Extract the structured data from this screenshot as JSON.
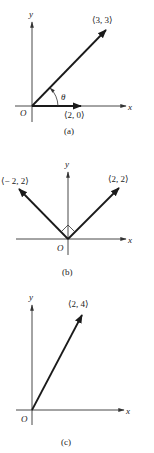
{
  "panels": [
    {
      "id": "a",
      "caption": "(a)",
      "axis_labels": {
        "x": "x",
        "y": "y",
        "origin": "O"
      },
      "vectors": [
        {
          "label": "⟨3, 3⟩",
          "components": [
            3,
            3
          ]
        },
        {
          "label": "⟨2, 0⟩",
          "components": [
            2,
            0
          ]
        }
      ],
      "angle_label": "θ"
    },
    {
      "id": "b",
      "caption": "(b)",
      "axis_labels": {
        "x": "x",
        "y": "y",
        "origin": "O"
      },
      "vectors": [
        {
          "label": "⟨− 2, 2⟩",
          "components": [
            -2,
            2
          ]
        },
        {
          "label": "⟨2, 2⟩",
          "components": [
            2,
            2
          ]
        }
      ],
      "right_angle_marker": true
    },
    {
      "id": "c",
      "caption": "(c)",
      "axis_labels": {
        "x": "x",
        "y": "y",
        "origin": "O"
      },
      "vectors": [
        {
          "label": "⟨2, 4⟩",
          "components": [
            2,
            4
          ]
        }
      ]
    }
  ]
}
